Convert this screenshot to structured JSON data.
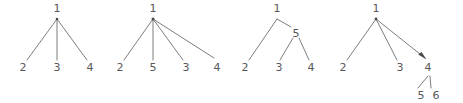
{
  "figure": {
    "background_color": "#ffffff",
    "edge_color": "#6e6e70",
    "label_color": "#58585a",
    "width": 463,
    "height": 103
  },
  "trees": [
    {
      "name": "tree-1",
      "root": "1",
      "root_pos": {
        "x": 57,
        "y": 8
      },
      "apex": {
        "x": 57,
        "y": 19
      },
      "children": [
        {
          "label": "2",
          "x": 23,
          "y": 71,
          "tip_x": 27,
          "tip_y": 60
        },
        {
          "label": "3",
          "x": 57,
          "y": 71,
          "tip_x": 57,
          "tip_y": 60
        },
        {
          "label": "4",
          "x": 90,
          "y": 71,
          "tip_x": 87,
          "tip_y": 60
        }
      ],
      "arrowheads": []
    },
    {
      "name": "tree-2",
      "root": "1",
      "root_pos": {
        "x": 153,
        "y": 8
      },
      "apex": {
        "x": 153,
        "y": 19
      },
      "children": [
        {
          "label": "2",
          "x": 120,
          "y": 71,
          "tip_x": 124,
          "tip_y": 60
        },
        {
          "label": "5",
          "x": 153,
          "y": 71,
          "tip_x": 153,
          "tip_y": 60
        },
        {
          "label": "3",
          "x": 186,
          "y": 71,
          "tip_x": 183,
          "tip_y": 60
        },
        {
          "label": "4",
          "x": 217,
          "y": 71,
          "tip_x": 214,
          "tip_y": 58
        }
      ],
      "arrowheads": []
    },
    {
      "name": "tree-3",
      "root": "1",
      "root_pos": {
        "x": 277,
        "y": 8
      },
      "apex": {
        "x": 277,
        "y": 19
      },
      "inner_node": {
        "label": "5",
        "x": 296,
        "y": 33
      },
      "children": [
        {
          "label": "2",
          "x": 245,
          "y": 71,
          "tip_x": 249,
          "tip_y": 60
        },
        {
          "label": "3",
          "x": 279,
          "y": 71,
          "tip_x": 280,
          "tip_y": 60
        },
        {
          "label": "4",
          "x": 311,
          "y": 71,
          "tip_x": 309,
          "tip_y": 60
        }
      ],
      "arrowheads": []
    },
    {
      "name": "tree-4",
      "root": "1",
      "root_pos": {
        "x": 376,
        "y": 8
      },
      "apex": {
        "x": 376,
        "y": 19
      },
      "inner_node": {
        "label": "4",
        "x": 428,
        "y": 71
      },
      "children": [
        {
          "label": "2",
          "x": 343,
          "y": 71,
          "tip_x": 347,
          "tip_y": 60
        },
        {
          "label": "3",
          "x": 400,
          "y": 71,
          "tip_x": 397,
          "tip_y": 60
        }
      ],
      "grandchildren": [
        {
          "label": "5",
          "x": 422,
          "y": 95,
          "tip_x": 418,
          "tip_y": 86
        },
        {
          "label": "6",
          "x": 436,
          "y": 95,
          "tip_x": 430,
          "tip_y": 86
        }
      ],
      "arrowheads": [
        {
          "target": "4",
          "x": 424,
          "y": 57
        }
      ]
    }
  ],
  "labels": {
    "all_node_values": [
      "1",
      "2",
      "3",
      "4",
      "5",
      "6"
    ]
  }
}
